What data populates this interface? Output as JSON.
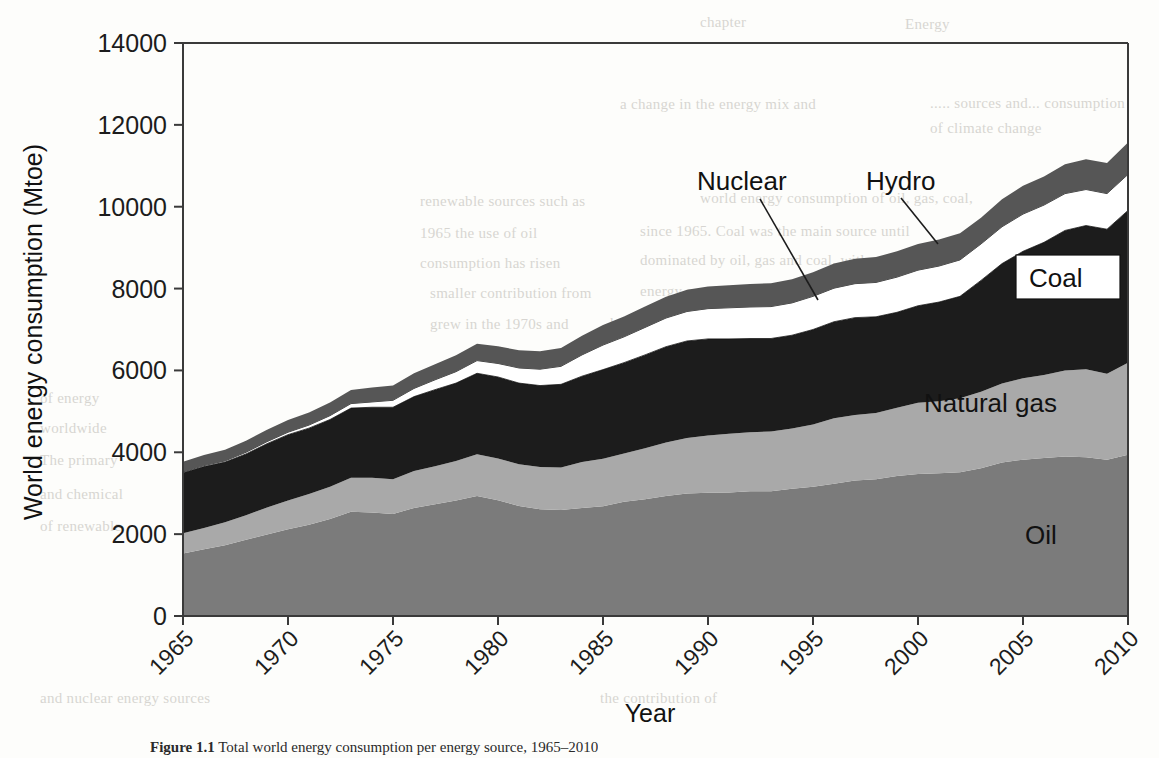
{
  "figure": {
    "caption_bold": "Figure 1.1",
    "caption_text": "Total world energy consumption per energy source, 1965–2010"
  },
  "axes": {
    "y_title": "World energy consumption (Mtoe)",
    "x_title": "Year",
    "y_ticks": [
      "0",
      "2000",
      "4000",
      "6000",
      "8000",
      "10000",
      "12000",
      "14000"
    ],
    "x_ticks": [
      "1965",
      "1970",
      "1975",
      "1980",
      "1985",
      "1990",
      "1995",
      "2000",
      "2005",
      "2010"
    ]
  },
  "labels": {
    "nuclear": "Nuclear",
    "hydro": "Hydro",
    "coal": "Coal",
    "natural_gas": "Natural gas",
    "oil": "Oil"
  },
  "colors": {
    "oil": "#7b7b7b",
    "natural_gas": "#a9a9a9",
    "coal": "#1c1c1c",
    "nuclear": "#ffffff",
    "hydro": "#565656",
    "axis": "#3a3a3a",
    "text": "#111111",
    "background": "#fdfdfb"
  },
  "ghost_text": [
    {
      "x": 700,
      "y": 14,
      "t": "chapter"
    },
    {
      "x": 905,
      "y": 16,
      "t": "Energy"
    },
    {
      "x": 930,
      "y": 95,
      "t": "..... sources and... consumption"
    },
    {
      "x": 620,
      "y": 96,
      "t": "a change in the energy mix and"
    },
    {
      "x": 930,
      "y": 120,
      "t": "of climate change"
    },
    {
      "x": 700,
      "y": 190,
      "t": "world energy consumption of oil, gas, coal,"
    },
    {
      "x": 420,
      "y": 193,
      "t": "renewable sources such as"
    },
    {
      "x": 640,
      "y": 223,
      "t": "since 1965. Coal was the main source until"
    },
    {
      "x": 420,
      "y": 225,
      "t": "1965 the use of oil"
    },
    {
      "x": 640,
      "y": 252,
      "t": "dominated by oil, gas and coal, with"
    },
    {
      "x": 420,
      "y": 255,
      "t": "consumption has risen"
    },
    {
      "x": 640,
      "y": 283,
      "t": "energy sources. Another energy source, nuclear,"
    },
    {
      "x": 430,
      "y": 285,
      "t": "smaller contribution from"
    },
    {
      "x": 610,
      "y": 315,
      "t": "has grown more slowly."
    },
    {
      "x": 430,
      "y": 316,
      "t": "grew in the 1970s and"
    },
    {
      "x": 40,
      "y": 390,
      "t": "of energy"
    },
    {
      "x": 40,
      "y": 420,
      "t": "worldwide"
    },
    {
      "x": 40,
      "y": 452,
      "t": "The primary"
    },
    {
      "x": 40,
      "y": 486,
      "t": "and chemical"
    },
    {
      "x": 40,
      "y": 518,
      "t": "of renewable"
    },
    {
      "x": 40,
      "y": 690,
      "t": "and nuclear energy sources"
    },
    {
      "x": 600,
      "y": 690,
      "t": "the contribution of"
    }
  ],
  "chart_data": {
    "type": "area",
    "stacked": true,
    "title": "",
    "xlabel": "Year",
    "ylabel": "World energy consumption (Mtoe)",
    "xlim": [
      1965,
      2010
    ],
    "ylim": [
      0,
      14000
    ],
    "grid": false,
    "legend": "inline-annotations",
    "x": [
      1965,
      1966,
      1967,
      1968,
      1969,
      1970,
      1971,
      1972,
      1973,
      1974,
      1975,
      1976,
      1977,
      1978,
      1979,
      1980,
      1981,
      1982,
      1983,
      1984,
      1985,
      1986,
      1987,
      1988,
      1989,
      1990,
      1991,
      1992,
      1993,
      1994,
      1995,
      1996,
      1997,
      1998,
      1999,
      2000,
      2001,
      2002,
      2003,
      2004,
      2005,
      2006,
      2007,
      2008,
      2009,
      2010
    ],
    "series": [
      {
        "name": "Oil",
        "color": "#7b7b7b",
        "values": [
          1530,
          1630,
          1730,
          1860,
          1990,
          2120,
          2230,
          2370,
          2550,
          2530,
          2490,
          2640,
          2730,
          2820,
          2930,
          2830,
          2690,
          2610,
          2590,
          2640,
          2680,
          2790,
          2850,
          2930,
          2990,
          3010,
          3020,
          3050,
          3050,
          3110,
          3160,
          3230,
          3310,
          3340,
          3420,
          3470,
          3490,
          3510,
          3610,
          3750,
          3820,
          3860,
          3900,
          3880,
          3820,
          3940
        ]
      },
      {
        "name": "Natural gas",
        "color": "#a9a9a9",
        "values": [
          490,
          520,
          560,
          600,
          660,
          700,
          750,
          790,
          830,
          850,
          850,
          900,
          930,
          970,
          1020,
          1020,
          1020,
          1030,
          1040,
          1120,
          1160,
          1180,
          1250,
          1310,
          1360,
          1400,
          1430,
          1440,
          1460,
          1470,
          1520,
          1600,
          1600,
          1620,
          1670,
          1740,
          1760,
          1810,
          1870,
          1930,
          1990,
          2030,
          2100,
          2150,
          2100,
          2250
        ]
      },
      {
        "name": "Coal",
        "color": "#1c1c1c",
        "values": [
          1480,
          1500,
          1470,
          1500,
          1560,
          1610,
          1610,
          1640,
          1700,
          1720,
          1760,
          1820,
          1870,
          1900,
          1980,
          1990,
          1980,
          1990,
          2030,
          2100,
          2180,
          2220,
          2280,
          2340,
          2370,
          2360,
          2320,
          2290,
          2270,
          2280,
          2320,
          2360,
          2380,
          2350,
          2330,
          2370,
          2420,
          2490,
          2720,
          2930,
          3100,
          3240,
          3420,
          3510,
          3530,
          3720
        ]
      },
      {
        "name": "Nuclear",
        "color": "#ffffff",
        "values": [
          20,
          25,
          30,
          40,
          50,
          60,
          75,
          95,
          110,
          130,
          170,
          200,
          240,
          280,
          310,
          330,
          370,
          400,
          440,
          520,
          600,
          630,
          670,
          700,
          720,
          740,
          760,
          770,
          780,
          790,
          810,
          820,
          830,
          840,
          860,
          870,
          880,
          890,
          890,
          900,
          910,
          910,
          900,
          880,
          870,
          880
        ]
      },
      {
        "name": "Hydro",
        "color": "#565656",
        "values": [
          250,
          260,
          270,
          280,
          290,
          300,
          310,
          320,
          330,
          350,
          360,
          370,
          380,
          400,
          410,
          420,
          430,
          440,
          450,
          470,
          490,
          500,
          510,
          520,
          530,
          540,
          550,
          560,
          570,
          580,
          590,
          600,
          610,
          620,
          630,
          640,
          650,
          650,
          640,
          670,
          690,
          700,
          720,
          740,
          750,
          780
        ]
      }
    ]
  }
}
